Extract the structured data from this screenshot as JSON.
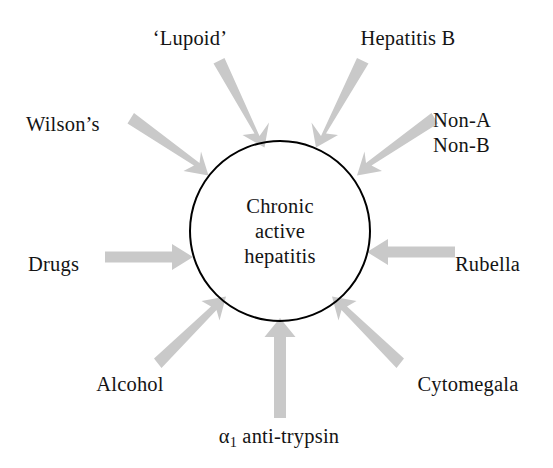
{
  "diagram": {
    "type": "radial-cause-diagram",
    "center": {
      "id": "chronic-active-hepatitis",
      "label": "Chronic\nactive\nhepatitis",
      "shape": "circle",
      "stroke_color": "#000000",
      "fill_color": "#ffffff"
    },
    "arrow_color": "#c9c9c9",
    "text_color": "#141414",
    "background_color": "#ffffff",
    "causes": [
      {
        "id": "lupoid",
        "label": "‘Lupoid’",
        "angle_deg": 290,
        "position": "top-left"
      },
      {
        "id": "hepatitis-b",
        "label": "Hepatitis B",
        "angle_deg": 250,
        "position": "top-right"
      },
      {
        "id": "non-a-non-b",
        "label": "Non-A\nNon-B",
        "angle_deg": 215,
        "position": "upper-right"
      },
      {
        "id": "wilsons",
        "label": "Wilson’s",
        "angle_deg": 325,
        "position": "upper-left"
      },
      {
        "id": "rubella",
        "label": "Rubella",
        "angle_deg": 180,
        "position": "right"
      },
      {
        "id": "drugs",
        "label": "Drugs",
        "angle_deg": 0,
        "position": "left"
      },
      {
        "id": "alcohol",
        "label": "Alcohol",
        "angle_deg": 35,
        "position": "lower-left"
      },
      {
        "id": "cytomegala",
        "label": "Cytomegala",
        "angle_deg": 145,
        "position": "lower-right"
      },
      {
        "id": "a1-antitrypsin",
        "label": "α1 anti-trypsin",
        "label_base": "α",
        "label_sub": "1",
        "label_rest": " anti-trypsin",
        "angle_deg": 90,
        "position": "bottom"
      }
    ]
  }
}
